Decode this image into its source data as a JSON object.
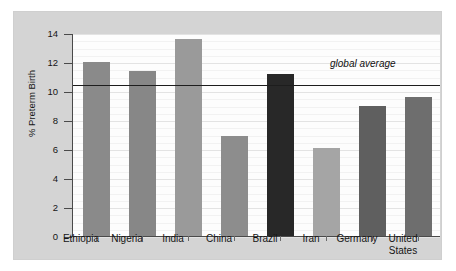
{
  "figure": {
    "background": "#ffffff",
    "panel_color": "#d4d4d4",
    "plot_background": "#fdfdfd",
    "axis_color": "#4a4a4a"
  },
  "chart_data": {
    "type": "bar",
    "title": "",
    "subtitle": "",
    "xlabel": "",
    "ylabel": "% Preterm Birth",
    "ylim": [
      0,
      14
    ],
    "yticks": [
      0,
      2,
      4,
      6,
      8,
      10,
      12,
      14
    ],
    "ytick_labels": [
      "0",
      "2",
      "4",
      "6",
      "8",
      "10",
      "12",
      "14"
    ],
    "grid": true,
    "legend": "none",
    "categories": [
      "Ethiopia",
      "Nigeria",
      "India",
      "China",
      "Brazil",
      "Iran",
      "Germany",
      "United\nStates"
    ],
    "values": [
      12.0,
      11.4,
      13.6,
      6.9,
      11.2,
      6.1,
      9.0,
      9.6
    ],
    "bar_colors": [
      "#8a8a8a",
      "#878787",
      "#9a9a9a",
      "#8d8d8d",
      "#282828",
      "#a5a5a5",
      "#5f5f5f",
      "#6e6e6e"
    ],
    "annotations": [
      {
        "name": "global-average",
        "label": "global average",
        "value": 10.5,
        "type": "hline",
        "color": "#1d1d1d"
      }
    ]
  }
}
